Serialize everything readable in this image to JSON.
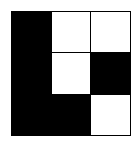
{
  "grid": {
    "rows": 3,
    "cols": 3,
    "cells": [
      [
        1,
        0,
        0
      ],
      [
        1,
        0,
        1
      ],
      [
        1,
        1,
        0
      ]
    ],
    "filled_color": "#000000",
    "empty_color": "#ffffff"
  }
}
